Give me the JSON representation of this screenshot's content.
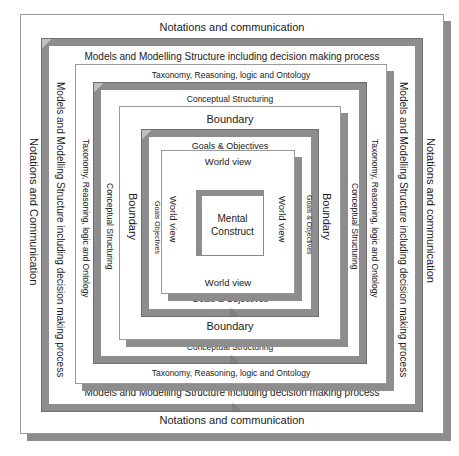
{
  "diagram": {
    "background": "#ffffff",
    "bevel_color": "#8d8d8d",
    "line_color": "#9a9a9a",
    "text_color": "#1a1a1a",
    "layers": [
      {
        "id": "notations",
        "name": "notations-and-communication",
        "top_label": "Notations and communication",
        "bottom_label": "Notations and communication",
        "left_label": "Notations and Communication",
        "right_label": "Notations and communication",
        "style": "flat",
        "font_size": 11
      },
      {
        "id": "models",
        "name": "models-and-modelling-structure",
        "top_label": "Models and Modelling Structure including decision making process",
        "bottom_label": "Models and Modelling Structure including decision making process",
        "left_label": "Models and Modelling Structure including decision making process",
        "right_label": "Models and Modelling Structure including decision making process",
        "style": "bevel",
        "font_size": 10
      },
      {
        "id": "taxonomy",
        "name": "taxonomy-reasoning-logic-ontology",
        "top_label": "Taxonomy, Reasoning, logic and Ontology",
        "bottom_label": "Taxonomy, Reasoning, logic and Ontology",
        "left_label": "Taxonomy, Reasoning, logic and Ontology",
        "right_label": "Taxonomy, Reasoning, logic and Ontology",
        "style": "flat",
        "font_size": 8.5
      },
      {
        "id": "conceptual",
        "name": "conceptual-structuring",
        "top_label": "Conceptual Structuring",
        "bottom_label": "Conceptual Structuring",
        "left_label": "Conceptual Structuring",
        "right_label": "Conceptual Structuring",
        "style": "bevel",
        "font_size": 8.5
      },
      {
        "id": "boundary",
        "name": "boundary",
        "top_label": "Boundary",
        "bottom_label": "Boundary",
        "left_label": "Boundary",
        "right_label": "Boundary",
        "style": "flat",
        "font_size": 11
      },
      {
        "id": "goals",
        "name": "goals-and-objectives",
        "top_label": "Goals & Objectives",
        "bottom_label": "Goals & Objectives",
        "left_label": "Goals Objectives",
        "right_label": "Goals & Objectives",
        "style": "bevel",
        "font_size": 9
      },
      {
        "id": "worldview",
        "name": "world-view",
        "top_label": "World view",
        "bottom_label": "World view",
        "left_label": "World view",
        "right_label": "World view",
        "style": "flat",
        "font_size": 9
      }
    ],
    "core": {
      "name": "mental-construct",
      "line_1": "Mental",
      "line_2": "Construct",
      "font_size": 10
    }
  }
}
